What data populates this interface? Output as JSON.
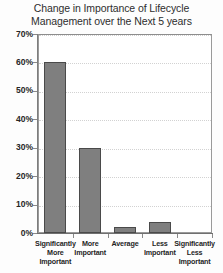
{
  "chart_data": {
    "type": "bar",
    "title": "Change in Importance of Lifecycle Management over the Next 5 years",
    "title_lines": [
      "Change in Importance of Lifecycle",
      "Management over the Next 5 years"
    ],
    "categories": [
      "Significantly More Important",
      "More Important",
      "Average",
      "Less Important",
      "Significantly Less Important"
    ],
    "category_label_lines": [
      [
        "Significantly",
        "More",
        "Important"
      ],
      [
        "More",
        "Important"
      ],
      [
        "Average"
      ],
      [
        "Less",
        "Important"
      ],
      [
        "Significantly",
        "Less",
        "Important"
      ]
    ],
    "values": [
      60,
      30,
      2,
      4,
      0
    ],
    "xlabel": "",
    "ylabel": "",
    "ylim": [
      0,
      70
    ],
    "ytick_values": [
      0,
      10,
      20,
      30,
      40,
      50,
      60,
      70
    ],
    "ytick_labels": [
      "0%",
      "10%",
      "20%",
      "30%",
      "40%",
      "50%",
      "60%",
      "70%"
    ],
    "grid": true,
    "grid_style": "dotted",
    "legend": false,
    "bar_color": "#7f7f7f",
    "bar_border_color": "#4a4a4a",
    "gridline_color": "#d2d2d2",
    "plot_border_color": "#9a9a9a",
    "title_color": "#2e2e2e",
    "tick_label_color": "#262626"
  }
}
